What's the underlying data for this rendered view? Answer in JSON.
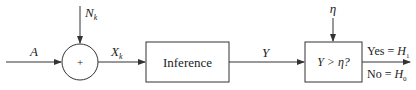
{
  "diagram": {
    "input_label": "A",
    "noise_label": "N",
    "noise_sub": "k",
    "adder_symbol": "+",
    "sum_label": "X",
    "sum_sub": "k",
    "inference_label": "Inference",
    "output_label": "Y",
    "threshold_label": "η",
    "decision_label": "Y > η?",
    "yes_label": "Yes = ",
    "yes_h": "H",
    "yes_sub": "1",
    "no_label": "No = ",
    "no_h": "H",
    "no_sub": "0"
  },
  "colors": {
    "stroke": "#333333",
    "text": "#222222"
  }
}
